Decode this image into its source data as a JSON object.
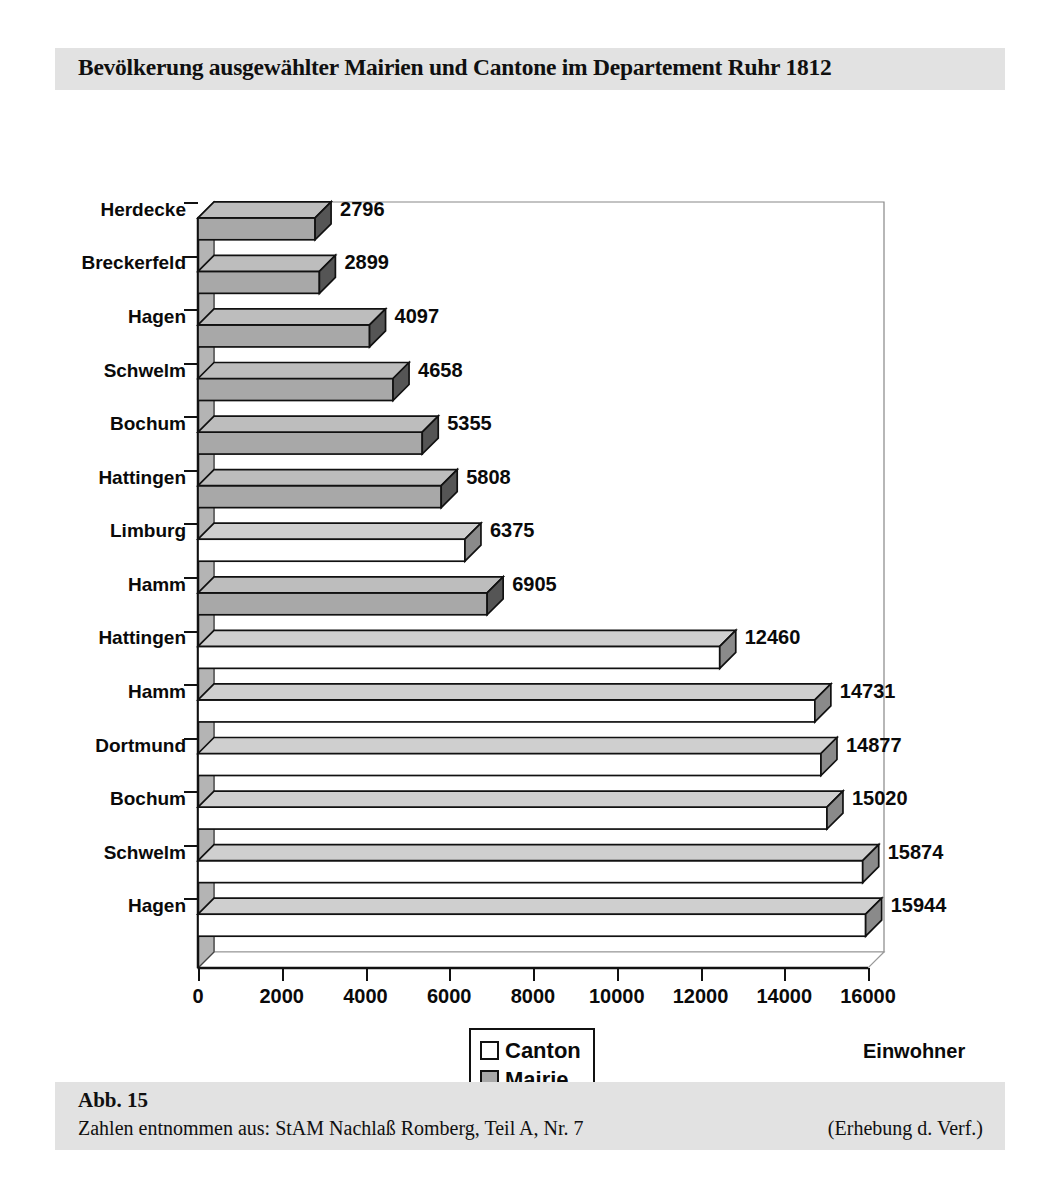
{
  "figure": {
    "title": "Bevölkerung ausgewählter Mairien und Cantone im Departement Ruhr 1812",
    "figure_number": "Abb. 15",
    "source": "Zahlen entnommen aus: StAM Nachlaß Romberg, Teil A, Nr. 7",
    "note": "(Erhebung d. Verf.)"
  },
  "legend": {
    "position": "bottom-center",
    "items": [
      {
        "label": "Canton",
        "color": "#ffffff"
      },
      {
        "label": "Mairie",
        "color": "#a8a8a8"
      }
    ]
  },
  "chart_data": {
    "type": "bar",
    "orientation": "horizontal",
    "title": "Bevölkerung ausgewählter Mairien und Cantone im Departement Ruhr 1812",
    "xlabel": "Einwohner",
    "ylabel": "",
    "xlim": [
      0,
      16000
    ],
    "xticks": [
      0,
      2000,
      4000,
      6000,
      8000,
      10000,
      12000,
      14000,
      16000
    ],
    "xtick_labels": [
      "0",
      "2000",
      "4000",
      "6000",
      "8000",
      "10000",
      "12000",
      "14000",
      "16000"
    ],
    "grid": false,
    "categories": [
      "Hagen",
      "Schwelm",
      "Bochum",
      "Dortmund",
      "Hamm",
      "Hattingen",
      "Hamm",
      "Limburg",
      "Hattingen",
      "Bochum",
      "Schwelm",
      "Hagen",
      "Breckerfeld",
      "Herdecke"
    ],
    "values": [
      15944,
      15874,
      15020,
      14877,
      14731,
      12460,
      6905,
      6375,
      5808,
      5355,
      4658,
      4097,
      2899,
      2796
    ],
    "value_labels": [
      "15944",
      "15874",
      "15020",
      "14877",
      "14731",
      "12460",
      "6905",
      "6375",
      "5808",
      "5355",
      "4658",
      "4097",
      "2899",
      "2796"
    ],
    "series_of_bar": [
      "Canton",
      "Canton",
      "Canton",
      "Canton",
      "Canton",
      "Canton",
      "Mairie",
      "Canton",
      "Mairie",
      "Mairie",
      "Mairie",
      "Mairie",
      "Mairie",
      "Mairie"
    ],
    "series": [
      {
        "name": "Canton",
        "color": "#ffffff",
        "points": [
          {
            "category": "Hagen",
            "value": 15944
          },
          {
            "category": "Schwelm",
            "value": 15874
          },
          {
            "category": "Bochum",
            "value": 15020
          },
          {
            "category": "Dortmund",
            "value": 14877
          },
          {
            "category": "Hamm",
            "value": 14731
          },
          {
            "category": "Hattingen",
            "value": 12460
          },
          {
            "category": "Limburg",
            "value": 6375
          }
        ]
      },
      {
        "name": "Mairie",
        "color": "#a8a8a8",
        "points": [
          {
            "category": "Hamm",
            "value": 6905
          },
          {
            "category": "Hattingen",
            "value": 5808
          },
          {
            "category": "Bochum",
            "value": 5355
          },
          {
            "category": "Schwelm",
            "value": 4658
          },
          {
            "category": "Hagen",
            "value": 4097
          },
          {
            "category": "Breckerfeld",
            "value": 2899
          },
          {
            "category": "Herdecke",
            "value": 2796
          }
        ]
      }
    ]
  }
}
